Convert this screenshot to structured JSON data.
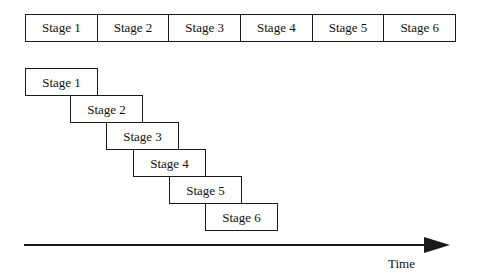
{
  "diagram": {
    "colors": {
      "stroke": "#1a1a1a",
      "fill": "#ffffff",
      "text": "#111111",
      "background": "#ffffff"
    },
    "sequential_row": {
      "name": "sequential-stage-row",
      "x": 25,
      "y": 14,
      "width": 431,
      "height": 28,
      "cells": [
        {
          "label": "Stage 1"
        },
        {
          "label": "Stage 2"
        },
        {
          "label": "Stage 3"
        },
        {
          "label": "Stage 4"
        },
        {
          "label": "Stage 5"
        },
        {
          "label": "Stage 6"
        }
      ]
    },
    "staircase": {
      "name": "pipelined-stage-staircase",
      "box_width": 73,
      "box_height": 28,
      "x_step": 36,
      "y_step": 27,
      "origin_x": 25,
      "origin_y": 68,
      "boxes": [
        {
          "label": "Stage 1",
          "x": 25,
          "y": 68
        },
        {
          "label": "Stage 2",
          "x": 70,
          "y": 95
        },
        {
          "label": "Stage 3",
          "x": 106,
          "y": 122
        },
        {
          "label": "Stage 4",
          "x": 133,
          "y": 149
        },
        {
          "label": "Stage 5",
          "x": 169,
          "y": 176
        },
        {
          "label": "Stage 6",
          "x": 205,
          "y": 203
        }
      ]
    },
    "time_axis": {
      "label": "Time",
      "line_x": 24,
      "line_y": 244,
      "line_width": 418,
      "arrow_tip_x": 450,
      "label_x": 388,
      "label_y": 256
    }
  }
}
